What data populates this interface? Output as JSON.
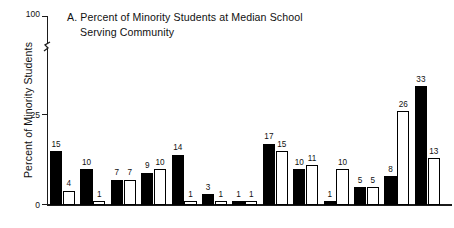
{
  "chart_data": {
    "type": "bar",
    "title": "A.  Percent of Minority Students at Median School Serving Community",
    "title_line_1": "A.  Percent of Minority Students at Median School",
    "title_line_2": "Serving Community",
    "panel_letter": "A.",
    "xlabel": "",
    "ylabel": "Percent of Minority Students",
    "ylim": [
      0,
      100
    ],
    "y_ticks": [
      0,
      25,
      100
    ],
    "y_tick_labels": [
      "0",
      "25",
      "100"
    ],
    "axis_break": true,
    "axis_break_between": [
      25,
      100
    ],
    "grid": false,
    "legend_position": "none",
    "categories": [
      "1",
      "2",
      "3",
      "4",
      "5",
      "6",
      "7",
      "8",
      "9",
      "10",
      "11",
      "12",
      "13"
    ],
    "series": [
      {
        "name": "black-bar",
        "style": "filled",
        "color": "#000000",
        "values": [
          15,
          10,
          7,
          9,
          14,
          3,
          1,
          17,
          10,
          1,
          5,
          8,
          33
        ]
      },
      {
        "name": "white-bar",
        "style": "open",
        "color": "#ffffff",
        "values": [
          4,
          1,
          7,
          10,
          1,
          1,
          1,
          15,
          11,
          10,
          5,
          26,
          13
        ]
      }
    ],
    "bars": [
      {
        "group": 1,
        "style": "filled",
        "value": 15,
        "label": "15"
      },
      {
        "group": 1,
        "style": "open",
        "value": 4,
        "label": "4"
      },
      {
        "group": 2,
        "style": "filled",
        "value": 10,
        "label": "10"
      },
      {
        "group": 2,
        "style": "open",
        "value": 1,
        "label": "1"
      },
      {
        "group": 3,
        "style": "filled",
        "value": 7,
        "label": "7"
      },
      {
        "group": 3,
        "style": "open",
        "value": 7,
        "label": "7"
      },
      {
        "group": 4,
        "style": "filled",
        "value": 9,
        "label": "9"
      },
      {
        "group": 4,
        "style": "open",
        "value": 10,
        "label": "10"
      },
      {
        "group": 5,
        "style": "filled",
        "value": 14,
        "label": "14"
      },
      {
        "group": 5,
        "style": "open",
        "value": 1,
        "label": "1"
      },
      {
        "group": 6,
        "style": "filled",
        "value": 3,
        "label": "3"
      },
      {
        "group": 6,
        "style": "open",
        "value": 1,
        "label": "1"
      },
      {
        "group": 7,
        "style": "filled",
        "value": 1,
        "label": "1"
      },
      {
        "group": 7,
        "style": "open",
        "value": 1,
        "label": "1"
      },
      {
        "group": 8,
        "style": "filled",
        "value": 17,
        "label": "17"
      },
      {
        "group": 8,
        "style": "open",
        "value": 15,
        "label": "15"
      },
      {
        "group": 9,
        "style": "filled",
        "value": 10,
        "label": "10"
      },
      {
        "group": 9,
        "style": "open",
        "value": 11,
        "label": "11"
      },
      {
        "group": 10,
        "style": "filled",
        "value": 1,
        "label": "1"
      },
      {
        "group": 10,
        "style": "open",
        "value": 10,
        "label": "10"
      },
      {
        "group": 11,
        "style": "filled",
        "value": 5,
        "label": "5"
      },
      {
        "group": 11,
        "style": "open",
        "value": 5,
        "label": "5"
      },
      {
        "group": 12,
        "style": "filled",
        "value": 8,
        "label": "8"
      },
      {
        "group": 12,
        "style": "open",
        "value": 26,
        "label": "26"
      },
      {
        "group": 13,
        "style": "filled",
        "value": 33,
        "label": "33"
      },
      {
        "group": 13,
        "style": "open",
        "value": 13,
        "label": "13"
      }
    ]
  },
  "colors": {
    "filled_bar": "#000000",
    "open_bar_fill": "#ffffff",
    "outline": "#000000",
    "axis": "#1b1b1b",
    "text": "#111111",
    "background": "#ffffff"
  }
}
